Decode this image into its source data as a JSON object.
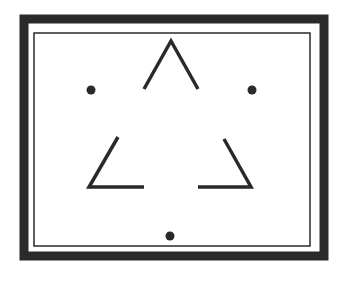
{
  "figure": {
    "description": "Kanizsa-style illusory triangle figure inside a double rectangular frame",
    "colors": {
      "ink": "#2a2a2a",
      "background": "#ffffff"
    },
    "outer_frame": {
      "x": 24,
      "y": 19,
      "w": 300,
      "h": 237,
      "stroke": 9
    },
    "inner_frame": {
      "x": 34,
      "y": 33,
      "w": 276,
      "h": 213,
      "stroke": 1.5
    },
    "strokes": [
      {
        "name": "top-apex-angle",
        "points": [
          [
            144,
            89
          ],
          [
            171,
            41
          ],
          [
            198,
            89
          ]
        ]
      },
      {
        "name": "left-bottom-angle",
        "points": [
          [
            118,
            137
          ],
          [
            89,
            187
          ],
          [
            144,
            187
          ]
        ]
      },
      {
        "name": "right-bottom-angle",
        "points": [
          [
            224,
            139
          ],
          [
            251,
            187
          ],
          [
            198,
            187
          ]
        ]
      }
    ],
    "dots": [
      {
        "name": "dot-left",
        "cx": 91,
        "cy": 90,
        "r": 4.5
      },
      {
        "name": "dot-right",
        "cx": 252,
        "cy": 90,
        "r": 4.5
      },
      {
        "name": "dot-bottom",
        "cx": 170,
        "cy": 236,
        "r": 4.5
      }
    ]
  }
}
